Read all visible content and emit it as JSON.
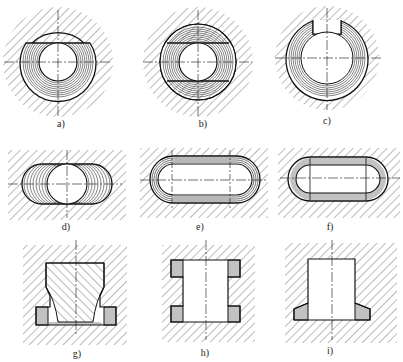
{
  "figure": {
    "panels": [
      {
        "id": "a",
        "label": "a)",
        "shape": "circular bore with flat-topped removal layers"
      },
      {
        "id": "b",
        "label": "b)",
        "shape": "circular bore with flat top and bottom removal layers"
      },
      {
        "id": "c",
        "label": "c)",
        "shape": "circular bore ring with top keyway notch"
      },
      {
        "id": "d",
        "label": "d)",
        "shape": "stadium slot with layered removal around circle"
      },
      {
        "id": "e",
        "label": "e)",
        "shape": "elongated slot with concentric contour layers"
      },
      {
        "id": "f",
        "label": "f)",
        "shape": "elongated slot with straight and rounded end layers"
      },
      {
        "id": "g",
        "label": "g)",
        "shape": "stepped cavity with tapered undercut"
      },
      {
        "id": "h",
        "label": "h)",
        "shape": "through hole with two internal grooves"
      },
      {
        "id": "i",
        "label": "i)",
        "shape": "blind hole with tapered bottom recess"
      }
    ]
  },
  "colors": {
    "line": "#1a1a1a",
    "hatch": "#555555",
    "background": "#ffffff"
  }
}
